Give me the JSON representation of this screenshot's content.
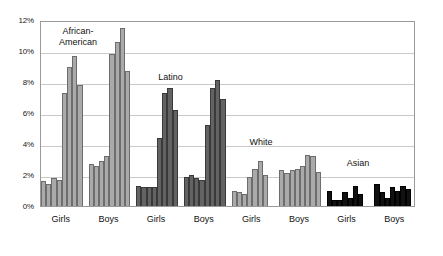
{
  "chart_data": {
    "type": "bar",
    "title": "",
    "subtitle": "",
    "xlabel": "",
    "ylabel": "",
    "ylim": [
      0,
      12
    ],
    "ytick_labels": [
      "0%",
      "2%",
      "4%",
      "6%",
      "8%",
      "10%",
      "12%"
    ],
    "ytick_values": [
      0,
      2,
      4,
      6,
      8,
      10,
      12
    ],
    "grid": true,
    "legend": "none",
    "annotations": [
      {
        "text": "African-\nAmerican",
        "group": "African-American"
      },
      {
        "text": "Latino",
        "group": "Latino"
      },
      {
        "text": "White",
        "group": "White"
      },
      {
        "text": "Asian",
        "group": "Asian"
      }
    ],
    "categories": [
      "Girls",
      "Boys",
      "Girls",
      "Boys",
      "Girls",
      "Boys",
      "Girls",
      "Boys"
    ],
    "groups": [
      {
        "ethnicity": "African-American",
        "gender": "Girls",
        "color": "#aaaaaa",
        "style": "light",
        "values": [
          1.6,
          1.4,
          1.8,
          1.7,
          7.3,
          9.0,
          9.7,
          7.8
        ]
      },
      {
        "ethnicity": "African-American",
        "gender": "Boys",
        "color": "#aaaaaa",
        "style": "light",
        "values": [
          2.7,
          2.6,
          2.9,
          3.2,
          9.8,
          10.6,
          11.5,
          8.7
        ]
      },
      {
        "ethnicity": "Latino",
        "gender": "Girls",
        "color": "#636363",
        "style": "dark",
        "values": [
          1.3,
          1.2,
          1.2,
          1.2,
          4.4,
          7.3,
          7.6,
          6.2
        ]
      },
      {
        "ethnicity": "Latino",
        "gender": "Boys",
        "color": "#636363",
        "style": "dark",
        "values": [
          1.9,
          2.0,
          1.8,
          1.7,
          5.2,
          7.6,
          8.1,
          6.9
        ]
      },
      {
        "ethnicity": "White",
        "gender": "Girls",
        "color": "#aaaaaa",
        "style": "light",
        "values": [
          1.0,
          0.9,
          0.8,
          1.9,
          2.4,
          2.9,
          2.0,
          0.0
        ]
      },
      {
        "ethnicity": "White",
        "gender": "Boys",
        "color": "#aaaaaa",
        "style": "light",
        "values": [
          2.3,
          2.1,
          2.3,
          2.4,
          2.6,
          3.3,
          3.2,
          2.2
        ]
      },
      {
        "ethnicity": "Asian",
        "gender": "Girls",
        "color": "#111111",
        "style": "black",
        "values": [
          1.0,
          0.4,
          0.4,
          0.9,
          0.5,
          1.3,
          0.8,
          0.0
        ]
      },
      {
        "ethnicity": "Asian",
        "gender": "Boys",
        "color": "#111111",
        "style": "black",
        "values": [
          1.4,
          0.9,
          0.5,
          1.2,
          1.0,
          1.3,
          1.1,
          0.0
        ]
      }
    ]
  },
  "axis": {
    "y_labels": [
      "12%",
      "10%",
      "8%",
      "6%",
      "4%",
      "2%",
      "0%"
    ],
    "x_labels": [
      "Girls",
      "Boys",
      "Girls",
      "Boys",
      "Girls",
      "Boys",
      "Girls",
      "Boys"
    ]
  },
  "labels": {
    "african_american": "African-\nAmerican",
    "latino": "Latino",
    "white": "White",
    "asian": "Asian"
  },
  "colors": {
    "light_bar": "#aaaaaa",
    "dark_bar": "#636363",
    "black_bar": "#111111",
    "gridline": "#c9c9c9",
    "frame": "#9a9a9a",
    "text": "#111111",
    "background": "#ffffff"
  }
}
